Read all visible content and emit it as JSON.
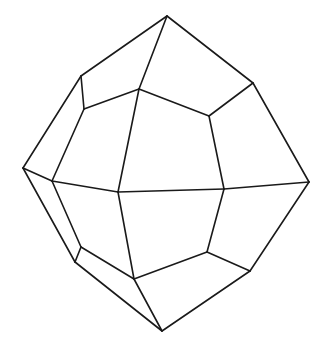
{
  "diagram": {
    "type": "polyhedron-line-drawing",
    "stroke_color": "#1a1a1a",
    "background": "#ffffff",
    "vertices": {
      "A": [
        167,
        16
      ],
      "B": [
        81,
        76
      ],
      "C": [
        139,
        89
      ],
      "D": [
        253,
        83
      ],
      "E": [
        84,
        109
      ],
      "F": [
        209,
        116
      ],
      "G": [
        23,
        168
      ],
      "H": [
        52,
        181
      ],
      "I": [
        118,
        192
      ],
      "J": [
        224,
        189
      ],
      "K": [
        309,
        182
      ],
      "L": [
        75,
        262
      ],
      "M": [
        81,
        247
      ],
      "N": [
        134,
        279
      ],
      "O": [
        207,
        252
      ],
      "P": [
        250,
        271
      ],
      "Q": [
        162,
        331
      ]
    },
    "edges": [
      [
        "A",
        "B"
      ],
      [
        "A",
        "C"
      ],
      [
        "A",
        "D"
      ],
      [
        "B",
        "E"
      ],
      [
        "B",
        "G"
      ],
      [
        "C",
        "E"
      ],
      [
        "C",
        "F"
      ],
      [
        "C",
        "I"
      ],
      [
        "D",
        "F"
      ],
      [
        "D",
        "K"
      ],
      [
        "E",
        "H"
      ],
      [
        "F",
        "J"
      ],
      [
        "G",
        "H"
      ],
      [
        "G",
        "L"
      ],
      [
        "H",
        "I"
      ],
      [
        "H",
        "M"
      ],
      [
        "I",
        "J"
      ],
      [
        "I",
        "N"
      ],
      [
        "J",
        "K"
      ],
      [
        "J",
        "O"
      ],
      [
        "K",
        "P"
      ],
      [
        "L",
        "M"
      ],
      [
        "L",
        "Q"
      ],
      [
        "M",
        "N"
      ],
      [
        "N",
        "O"
      ],
      [
        "N",
        "Q"
      ],
      [
        "O",
        "P"
      ],
      [
        "P",
        "Q"
      ]
    ]
  }
}
